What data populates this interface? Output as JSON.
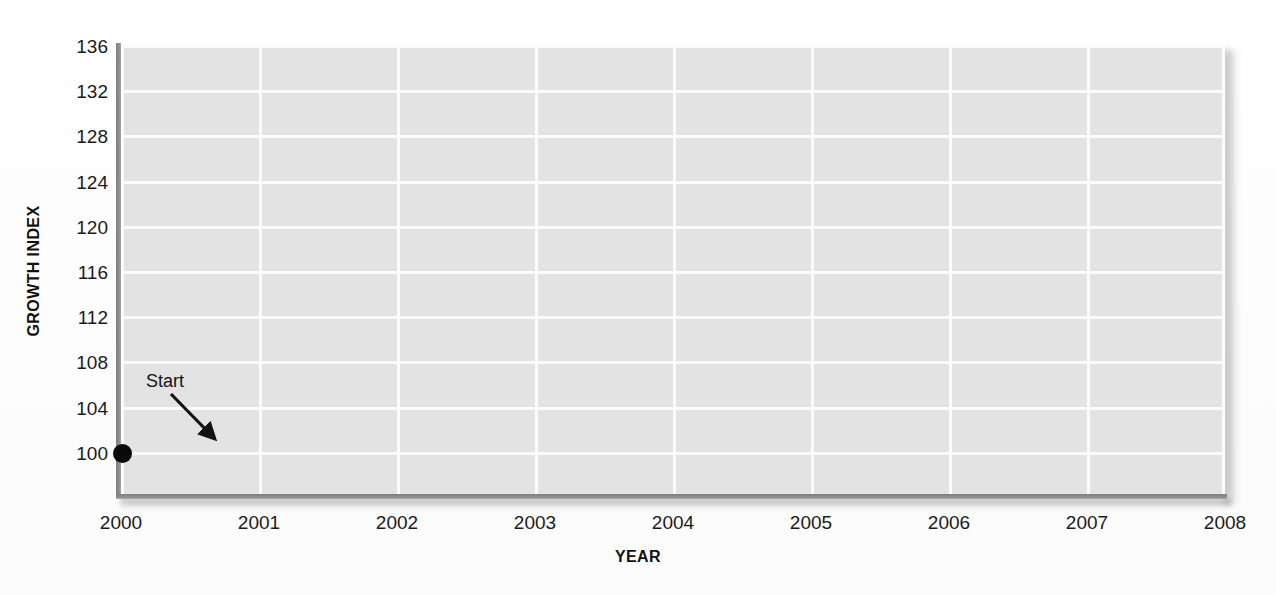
{
  "chart_data": {
    "type": "scatter",
    "title": "",
    "xlabel": "YEAR",
    "ylabel": "GROWTH INDEX",
    "x_tick_labels": [
      "2000",
      "2001",
      "2002",
      "2003",
      "2004",
      "2005",
      "2006",
      "2007",
      "2008"
    ],
    "y_tick_labels": [
      "136",
      "132",
      "128",
      "124",
      "120",
      "116",
      "112",
      "108",
      "104",
      "100"
    ],
    "xlim": [
      2000,
      2008
    ],
    "ylim": [
      98,
      136
    ],
    "y_tick_step": 4,
    "grid": true,
    "legend": false,
    "series": [
      {
        "name": "Growth Index",
        "points": [
          {
            "x": 2000,
            "y": 100,
            "label": "Start"
          }
        ]
      }
    ],
    "annotations": [
      {
        "text": "Start",
        "points_to_x": 2000,
        "points_to_y": 100
      }
    ],
    "colors": {
      "plot_background": "#e3e3e3",
      "gridline": "#fbfbfb",
      "axis": "#8d8d8d",
      "marker": "#0a0a0a",
      "text": "#1b1b1b",
      "page_background": "#fefefe"
    }
  },
  "axis": {
    "y_title": "GROWTH INDEX",
    "x_title": "YEAR"
  },
  "ticks": {
    "y": [
      "136",
      "132",
      "128",
      "124",
      "120",
      "116",
      "112",
      "108",
      "104",
      "100"
    ],
    "x": [
      "2000",
      "2001",
      "2002",
      "2003",
      "2004",
      "2005",
      "2006",
      "2007",
      "2008"
    ]
  },
  "annotation": {
    "start_label": "Start"
  }
}
